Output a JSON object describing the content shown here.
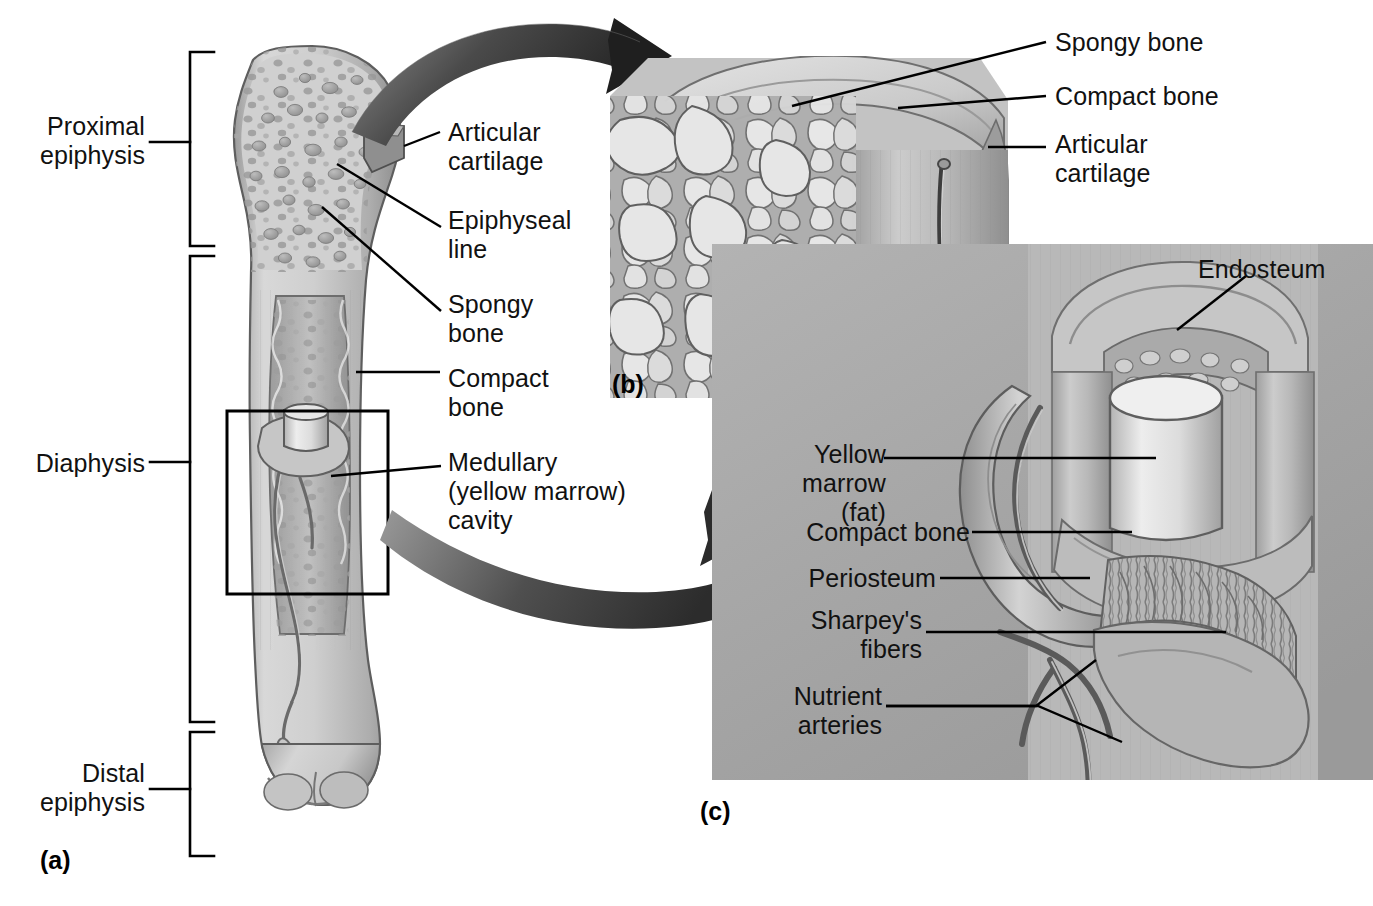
{
  "figure": {
    "background_color": "#ffffff",
    "ink_color": "#111111",
    "panel_c_bg": "#a9a9a9"
  },
  "panels": [
    {
      "id": "panel-a",
      "marker": "(a)",
      "caption": "Gross anatomy of a long bone, frontal section"
    },
    {
      "id": "panel-b",
      "marker": "(b)",
      "caption": "Enlargement of proximal epiphysis showing spongy and compact bone"
    },
    {
      "id": "panel-c",
      "marker": "(c)",
      "caption": "Enlargement of diaphysis wall showing periosteum and marrow cavity"
    }
  ],
  "panel_a": {
    "marker": "(a)",
    "brackets": [
      {
        "name": "proximal-epiphysis",
        "label": "Proximal\nepiphysis"
      },
      {
        "name": "diaphysis",
        "label": "Diaphysis"
      },
      {
        "name": "distal-epiphysis",
        "label": "Distal\nepiphysis"
      }
    ],
    "callouts": [
      {
        "name": "articular-cartilage",
        "label": "Articular\ncartilage"
      },
      {
        "name": "epiphyseal-line",
        "label": "Epiphyseal\nline"
      },
      {
        "name": "spongy-bone",
        "label": "Spongy\nbone"
      },
      {
        "name": "compact-bone",
        "label": "Compact\nbone"
      },
      {
        "name": "medullary-cavity",
        "label": "Medullary\n(yellow marrow)\ncavity"
      }
    ],
    "magnifier_box": {
      "name": "diaphysis-detail-box"
    }
  },
  "panel_b": {
    "marker": "(b)",
    "callouts": [
      {
        "name": "spongy-bone",
        "label": "Spongy bone"
      },
      {
        "name": "compact-bone",
        "label": "Compact bone"
      },
      {
        "name": "articular-cartilage",
        "label": "Articular\ncartilage"
      }
    ]
  },
  "panel_c": {
    "marker": "(c)",
    "callouts": [
      {
        "name": "endosteum",
        "label": "Endosteum"
      },
      {
        "name": "yellow-marrow",
        "label": "Yellow\nmarrow (fat)"
      },
      {
        "name": "compact-bone",
        "label": "Compact bone"
      },
      {
        "name": "periosteum",
        "label": "Periosteum"
      },
      {
        "name": "sharpeys-fibers",
        "label": "Sharpey's\nfibers"
      },
      {
        "name": "nutrient-arteries",
        "label": "Nutrient\narteries"
      }
    ]
  },
  "arrows": [
    {
      "name": "arrow-a-to-b",
      "from": "panel-a-proximal-epiphysis",
      "to": "panel-b"
    },
    {
      "name": "arrow-a-to-c",
      "from": "panel-a-diaphysis-box",
      "to": "panel-c"
    }
  ]
}
